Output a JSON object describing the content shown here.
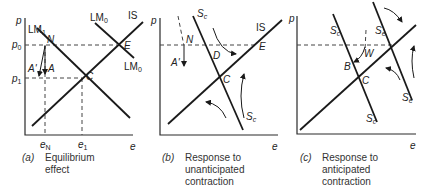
{
  "figure": {
    "panels": [
      {
        "id": "a",
        "caption_tag": "(a)",
        "caption_lines": [
          "Equilibrium",
          "effect"
        ],
        "y_axis_label": "p",
        "x_axis_label": "e",
        "y_ticks": [
          {
            "base": "p",
            "sub": "0"
          },
          {
            "base": "p",
            "sub": "1"
          }
        ],
        "x_ticks": [
          {
            "base": "e",
            "sub": "N"
          },
          {
            "base": "e",
            "sub": "1"
          }
        ],
        "curves": [
          {
            "base": "LM",
            "sub": "1"
          },
          {
            "base": "LM",
            "sub": "0"
          },
          {
            "base": "IS",
            "sub": ""
          }
        ],
        "points": [
          "N",
          "E",
          "C",
          "A",
          "A'"
        ]
      },
      {
        "id": "b",
        "caption_tag": "(b)",
        "caption_lines": [
          "Response to",
          "unanticipated",
          "contraction"
        ],
        "y_axis_label": "p",
        "x_axis_label": "e",
        "curves": [
          {
            "base": "S",
            "sub": "c"
          },
          {
            "base": "IS",
            "sub": ""
          }
        ],
        "points": [
          "N",
          "A'",
          "D",
          "E",
          "C"
        ]
      },
      {
        "id": "c",
        "caption_tag": "(c)",
        "caption_lines": [
          "Response to",
          "anticipated",
          "contraction"
        ],
        "y_axis_label": "p",
        "x_axis_label": "e",
        "curves": [
          {
            "base": "S",
            "sub": "c"
          },
          {
            "base": "S",
            "sub": "e"
          }
        ],
        "points": [
          "W",
          "B",
          "C"
        ]
      }
    ]
  }
}
